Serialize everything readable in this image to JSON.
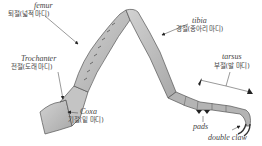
{
  "diagram": {
    "labels": {
      "femur": {
        "en": "femur",
        "ko": "퇴절(넓적 마디)"
      },
      "trochanter": {
        "en": "Trochanter",
        "ko": "전절(도래 마디)"
      },
      "coxa": {
        "en": "Coxa",
        "ko": "기절(밑 마디)"
      },
      "tibia": {
        "en": "tibia",
        "ko": "경절(종아리 마디)"
      },
      "tarsus": {
        "en": "tarsus",
        "ko": "부절(발 마디)"
      },
      "pads": {
        "en": "pads"
      },
      "double_claw": {
        "en": "double claw"
      }
    },
    "colors": {
      "segment_fill": "#bdbdbd",
      "segment_dark": "#8a8a8a",
      "outline": "#555555",
      "arrow": "#222222"
    }
  }
}
